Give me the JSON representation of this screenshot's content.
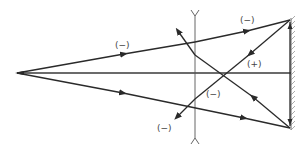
{
  "diagram": {
    "type": "optical ray diagram",
    "elements": {
      "source": "point source on optical axis",
      "lens": "diverging lens (concave)",
      "mirror": "plane mirror"
    },
    "labels": {
      "upper_incident": "(−)",
      "reflected_upper": "(+)",
      "reflected_cross": "(−)",
      "lower_exit": "(−)"
    },
    "colors": {
      "ray": "#2a2a2a",
      "lens": "#555555",
      "label": "#444444"
    }
  }
}
